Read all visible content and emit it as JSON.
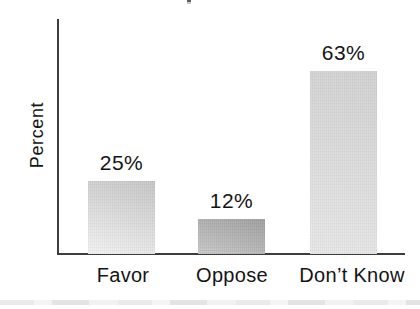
{
  "chart_data": {
    "type": "bar",
    "ylabel": "Percent",
    "categories": [
      "Favor",
      "Oppose",
      "Don’t Know"
    ],
    "values": [
      25,
      12,
      63
    ],
    "value_labels": [
      "25%",
      "12%",
      "63%"
    ],
    "ylim": [
      0,
      80
    ],
    "grid": false,
    "legend": "none",
    "bar_colors": [
      {
        "top": "#c6c6c6",
        "bottom": "#f3f3f3"
      },
      {
        "top": "#9f9f9f",
        "bottom": "#c8c8c8"
      },
      {
        "top": "#d2d2d2",
        "bottom": "#e8e8e8"
      }
    ],
    "axis_color": "#3d3d3d",
    "text_color": "#141414"
  },
  "artifacts": {
    "bottom_band_color": "#eaeaea"
  }
}
